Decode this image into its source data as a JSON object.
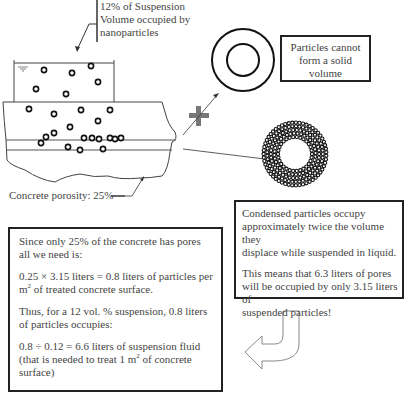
{
  "labels": {
    "suspension_note": [
      "12% of Suspension",
      "Volume occupied by",
      "nanoparticles"
    ],
    "porosity": "Concrete porosity: 25%",
    "plus_sign": "+"
  },
  "box_solid": {
    "lines": [
      "Particles cannot",
      "form a solid",
      "volume"
    ]
  },
  "box_condensed": {
    "para1": [
      "Condensed particles occupy",
      "approximately twice the volume they",
      "displace while suspended in liquid."
    ],
    "para2": [
      " This means that 6.3 liters of pores",
      "will be occupied by only 3.15 liters of",
      "suspended particles!"
    ]
  },
  "box_calc": {
    "para1": [
      "Since only 25% of the concrete has pores",
      "all we need is:"
    ],
    "para2_line1": "0.25 × 3.15 liters = 0.8 liters of particles per",
    "para2_line2_pre": "m",
    "para2_line2_sup": "2",
    "para2_line2_post": " of treated concrete surface.",
    "para3": [
      "Thus, for a 12 vol. % suspension, 0.8 liters",
      "of particles occupies:"
    ],
    "para4_line1": "0.8  ÷ 0.12  = 6.6 liters of suspension fluid",
    "para4_line2_pre": "(that is needed to treat 1 m",
    "para4_line2_sup": "2",
    "para4_line2_post": " of concrete",
    "para4_line3": "surface)"
  },
  "colors": {
    "line": "#222222",
    "plus": "#777777",
    "arrow_outline": "#888888"
  }
}
